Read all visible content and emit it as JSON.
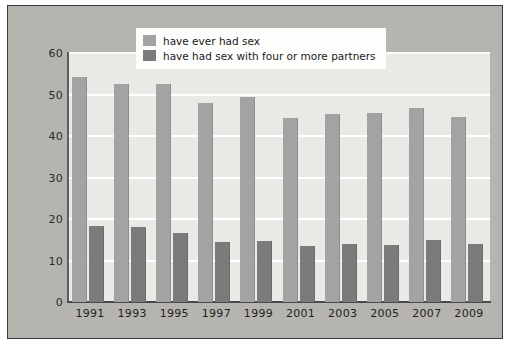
{
  "chart_data": {
    "type": "bar",
    "title": "",
    "xlabel": "",
    "ylabel": "",
    "ylim": [
      0,
      60
    ],
    "yticks": [
      0,
      10,
      20,
      30,
      40,
      50,
      60
    ],
    "ytick_labels": [
      "0",
      "10",
      "20",
      "30",
      "40",
      "50",
      "60"
    ],
    "grid": "horizontal",
    "legend_position": "top-center",
    "categories": [
      "1991",
      "1993",
      "1995",
      "1997",
      "1999",
      "2001",
      "2003",
      "2005",
      "2007",
      "2009"
    ],
    "series": [
      {
        "name": "have ever had sex",
        "color": "#a3a3a3",
        "values": [
          54.1,
          52.6,
          52.5,
          48.0,
          49.3,
          44.4,
          45.4,
          45.6,
          46.7,
          44.5
        ]
      },
      {
        "name": "have had sex with four or more partners",
        "color": "#7b7b7b",
        "values": [
          18.2,
          18.1,
          16.7,
          14.5,
          14.6,
          13.6,
          14.0,
          13.7,
          15.0,
          13.9
        ]
      }
    ]
  },
  "legend": {
    "items": [
      {
        "label": "have ever had sex",
        "swatch": "ever"
      },
      {
        "label": "have had sex with four or more partners",
        "swatch": "four"
      }
    ]
  },
  "colors": {
    "figure_background": "#b6b4af",
    "plot_background": "#ebe9e6",
    "gridline": "#ffffff",
    "axis": "#4a4a4a",
    "series_light": "#a3a3a3",
    "series_dark": "#7b7b7b",
    "text": "#1f1f1f"
  }
}
